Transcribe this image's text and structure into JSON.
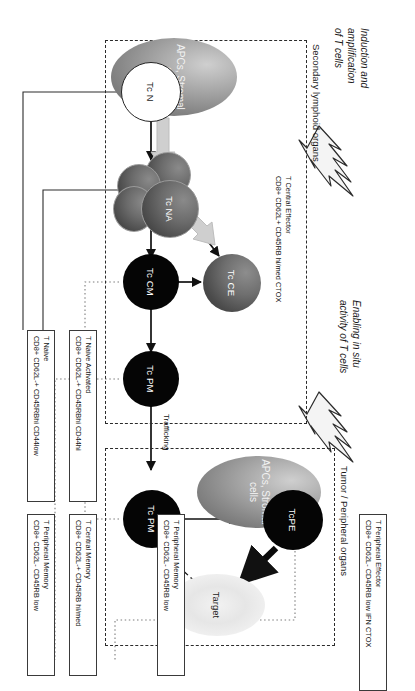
{
  "figure": {
    "regions": [
      {
        "id": "secondary",
        "label": "Secondary lymphoid organs"
      },
      {
        "id": "tumor",
        "label": "Tumor / Peripheral organs"
      }
    ],
    "phases": [
      {
        "id": "induction",
        "line1": "Induction and",
        "line2": "amplification",
        "line3": "of T cells"
      },
      {
        "id": "enabling",
        "line1": "Enabling in situ",
        "line2": "activity of T cells"
      }
    ],
    "cells": [
      {
        "id": "tc-n",
        "label": "Tc N",
        "style": "white"
      },
      {
        "id": "tc-na",
        "label": "Tc NA",
        "style": "gray-cluster"
      },
      {
        "id": "tc-cm",
        "label": "Tc CM",
        "style": "black"
      },
      {
        "id": "tc-ce",
        "label": "Tc CE",
        "style": "gray"
      },
      {
        "id": "tc-pm-lymphoid",
        "label": "Tc PM",
        "style": "black"
      },
      {
        "id": "tc-pm-peripheral",
        "label": "Tc PM",
        "style": "black"
      },
      {
        "id": "tc-pe",
        "label": "TcPE",
        "style": "black"
      }
    ],
    "ellipses": [
      {
        "id": "apc-lymphoid",
        "line1": "APCs, Stromal",
        "line2": "cells"
      },
      {
        "id": "apc-peripheral",
        "line1": "APCs, Stromal",
        "line2": "cells"
      },
      {
        "id": "target",
        "line1": "Target",
        "line2": ""
      }
    ],
    "edge_labels": [
      {
        "id": "trafficking",
        "label": "Trafficking"
      }
    ],
    "inline_labels": [
      {
        "id": "t-central-effector",
        "line1": "T Central Effector",
        "line2": "CD8+ CD62L+ CD45RB hi/med  CTOX"
      }
    ],
    "legends": [
      {
        "id": "t-naive",
        "line1": "T Naive",
        "line2": "CD8+ CD62L-+ CD45RBhi  CD44low"
      },
      {
        "id": "t-naive-activated",
        "line1": "T Naive Activated",
        "line2": "CD8+ CD62L-+ CD45RBhi  CD44hi"
      },
      {
        "id": "t-central-memory",
        "line1": "T Central Memory",
        "line2": "CD8+ CD62L-+ CD45RB  hi/med"
      },
      {
        "id": "t-peripheral-memory-lymphoid",
        "line1": "T Peripheral Memory",
        "line2": "CD8+ CD62L-  CD45RB low"
      },
      {
        "id": "t-peripheral-memory",
        "line1": "T Peripheral Memory",
        "line2": "CD8+ CD62L-  CD45RB low"
      },
      {
        "id": "t-peripheral-effector",
        "line1": "T Peripheral Effector",
        "line2": "CD8+ CD62L-  CD45RB low  IFN CTOX"
      }
    ],
    "colors": {
      "cell_black": "#050505",
      "cell_gray": "#5a5a5a",
      "arrow_black": "#111111",
      "arrow_gray": "#bdbdbd",
      "dashed_border": "#2b2b2b",
      "background": "#ffffff"
    }
  }
}
